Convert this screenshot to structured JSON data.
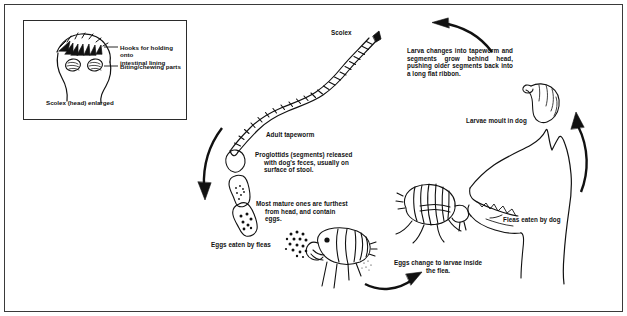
{
  "figure": {
    "title_label": "Scolex",
    "background_color": "#ffffff",
    "ink_color": "#111111",
    "border_color": "#3a3a3a"
  },
  "inset": {
    "name": "scolex-detail-inset",
    "caption": "Scolex (head) enlarged",
    "callouts": [
      {
        "id": "hooks",
        "text": "Hooks for holding onto\nintestinal lining"
      },
      {
        "id": "biting",
        "text": "Biting/chewing parts"
      }
    ]
  },
  "labels": {
    "scolex": "Scolex",
    "adult_tapeworm": "Adult tapeworm",
    "proglottids": "Proglottids (segments) released\nwith dog's feces, usually on\nsurface of stool.",
    "most_mature": "Most mature ones are furthest\nfrom head, and contain\neggs.",
    "eggs_eaten_by_fleas": "Eggs eaten by fleas",
    "eggs_change_to_larvae": "Eggs change to larvae inside\nthe flea.",
    "fleas_eaten_by_dog": "Fleas eaten by dog",
    "larvae_moult_in_dog": "Larvae moult in dog",
    "larva_changes": "Larva changes into tapeworm and segments grow behind head, pushing older segments back into a long flat ribbon."
  },
  "illustrations": [
    {
      "id": "scolex-head-drawing",
      "description": "enlarged tapeworm head with hooks and suckers"
    },
    {
      "id": "adult-tapeworm-drawing",
      "description": "segmented ribbon tapeworm body"
    },
    {
      "id": "proglottid-segment-upper",
      "description": "detached tapeworm segment"
    },
    {
      "id": "proglottid-segment-middle",
      "description": "detached tapeworm segment with eggs"
    },
    {
      "id": "proglottid-segment-lower",
      "description": "mature tapeworm segment full of eggs"
    },
    {
      "id": "flea-eating-eggs-drawing",
      "description": "flea facing left ingesting tapeworm eggs"
    },
    {
      "id": "flea-with-larvae-drawing",
      "description": "flea facing right containing larvae"
    },
    {
      "id": "dog-head-drawing",
      "description": "dog head in profile with open mouth"
    },
    {
      "id": "larva-drawing",
      "description": "tapeworm larva moulting in dog"
    }
  ],
  "arrows": [
    {
      "id": "arrow-top-leftward",
      "direction": "left"
    },
    {
      "id": "arrow-left-downward",
      "direction": "down"
    },
    {
      "id": "arrow-bottom-rightward",
      "direction": "right"
    },
    {
      "id": "arrow-right-upward",
      "direction": "up"
    }
  ]
}
